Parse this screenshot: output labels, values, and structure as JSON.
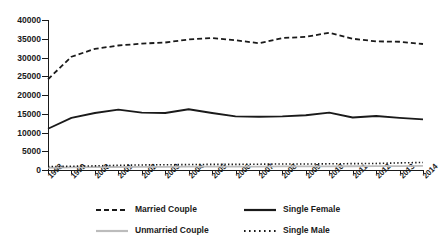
{
  "chart_data": {
    "type": "line",
    "title": "",
    "xlabel": "",
    "ylabel": "",
    "x": [
      "1998",
      "1999",
      "2000",
      "2001",
      "2002",
      "2003",
      "2004",
      "2005",
      "2006",
      "2007",
      "2008",
      "2009",
      "2010",
      "2011",
      "2012",
      "2013",
      "2014"
    ],
    "categories": [
      "1998",
      "1999",
      "2000",
      "2001",
      "2002",
      "2003",
      "2004",
      "2005",
      "2006",
      "2007",
      "2008",
      "2009",
      "2010",
      "2011",
      "2012",
      "2013",
      "2014"
    ],
    "ylim": [
      0,
      40000
    ],
    "yticks": [
      0,
      5000,
      10000,
      15000,
      20000,
      25000,
      30000,
      35000,
      40000
    ],
    "ytick_labels": [
      "0",
      "5000",
      "10000",
      "15000",
      "20000",
      "25000",
      "30000",
      "35000",
      "40000"
    ],
    "grid": false,
    "legend_position": "bottom",
    "series": [
      {
        "name": "Married Couple",
        "style": "dashed",
        "color": "#1a1a1a",
        "values": [
          24200,
          30200,
          32300,
          33200,
          33700,
          34000,
          34800,
          35200,
          34600,
          33800,
          35200,
          35500,
          36600,
          35000,
          34300,
          34200,
          33600
        ]
      },
      {
        "name": "Single Female",
        "style": "solid",
        "color": "#1a1a1a",
        "values": [
          11000,
          13900,
          15200,
          16100,
          15300,
          15200,
          16200,
          15200,
          14300,
          14200,
          14300,
          14600,
          15300,
          14000,
          14400,
          13900,
          13500
        ]
      },
      {
        "name": "Unmarried Couple",
        "style": "solid",
        "color": "#bcbcbc",
        "values": [
          600,
          700,
          750,
          800,
          820,
          850,
          880,
          900,
          900,
          920,
          950,
          950,
          980,
          1000,
          1020,
          1050,
          1080
        ]
      },
      {
        "name": "Single Male",
        "style": "dotted",
        "color": "#1a1a1a",
        "values": [
          900,
          1000,
          1100,
          1250,
          1350,
          1400,
          1450,
          1500,
          1500,
          1550,
          1600,
          1600,
          1650,
          1700,
          1750,
          1900,
          2000
        ]
      }
    ]
  },
  "legend": {
    "items": [
      {
        "label": "Married Couple",
        "style": "dashed",
        "color": "#1a1a1a"
      },
      {
        "label": "Single Female",
        "style": "solid",
        "color": "#1a1a1a"
      },
      {
        "label": "Unmarried Couple",
        "style": "solid",
        "color": "#bcbcbc"
      },
      {
        "label": "Single Male",
        "style": "dotted",
        "color": "#1a1a1a"
      }
    ]
  }
}
